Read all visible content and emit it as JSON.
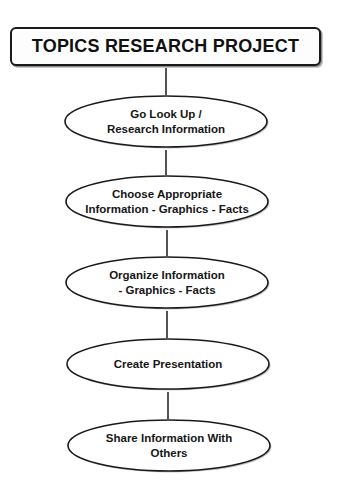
{
  "diagram": {
    "title": "TOPICS RESEARCH PROJECT",
    "type": "vertical-flowchart",
    "colors": {
      "stroke": "#1a1a1a",
      "fill": "#ffffff",
      "text": "#111111",
      "shadow": "#9a9a9a"
    },
    "steps": [
      {
        "label": "Go Look Up /\nResearch Information"
      },
      {
        "label": "Choose Appropriate\nInformation - Graphics - Facts"
      },
      {
        "label": "Organize Information\n- Graphics - Facts"
      },
      {
        "label": "Create Presentation"
      },
      {
        "label": "Share Information With\nOthers"
      }
    ],
    "edges": [
      {
        "from": "title",
        "to": "step-1"
      },
      {
        "from": "step-1",
        "to": "step-2"
      },
      {
        "from": "step-2",
        "to": "step-3"
      },
      {
        "from": "step-3",
        "to": "step-4"
      },
      {
        "from": "step-4",
        "to": "step-5"
      }
    ]
  }
}
